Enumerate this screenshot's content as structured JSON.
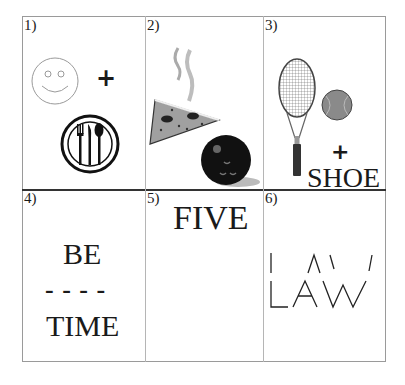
{
  "puzzle": {
    "cells": [
      {
        "number": "1)",
        "description": "smiley face + plate with fork, knife and spoon",
        "plus": "+"
      },
      {
        "number": "2)",
        "description": "steaming pizza slice and bowling ball"
      },
      {
        "number": "3)",
        "description": "tennis racket and tennis ball + SHOE",
        "plus": "+",
        "word": "SHOE"
      },
      {
        "number": "4)",
        "top_word": "BE",
        "dashes": "- - - -",
        "bottom_word": "TIME"
      },
      {
        "number": "5)",
        "word": "FIVE"
      },
      {
        "number": "6)",
        "word": "LAW",
        "description": "upper strokes of LAW above full LAW"
      }
    ]
  },
  "colors": {
    "text": "#1a1a1a",
    "grid_line": "#9a9a9a",
    "middle_divider": "#333333",
    "bowling_ball": "#111111",
    "tennis_ball": "#8a8a8a",
    "pizza": "#9a9a9a",
    "steam": "#bdbdbd"
  }
}
